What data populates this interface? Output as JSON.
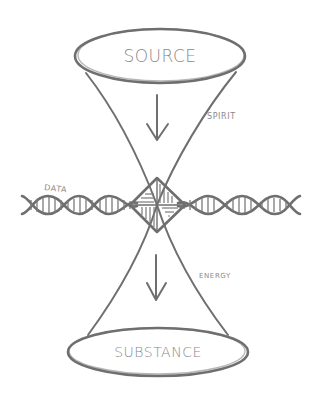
{
  "diagram": {
    "type": "hand-drawn hourglass / double-cone diagram",
    "colors": {
      "ink": "#6f6f6f",
      "text": "#8a8a8a",
      "background": "#ffffff"
    },
    "nodes": {
      "top": {
        "label": "SOURCE",
        "shape": "ellipse"
      },
      "bottom": {
        "label": "SUBSTANCE",
        "shape": "ellipse"
      },
      "center": {
        "label": "",
        "shape": "diamond with hatched pinwheel triangles"
      }
    },
    "labels": {
      "spirit": "SPIRIT",
      "data": "DATA",
      "energy": "ENERGY"
    },
    "arrows": [
      {
        "from": "SOURCE",
        "to": "center",
        "direction": "down"
      },
      {
        "from": "center",
        "to": "SUBSTANCE",
        "direction": "down"
      }
    ],
    "helix": {
      "label": "DATA",
      "orientation": "horizontal",
      "passes_through": "center"
    }
  }
}
